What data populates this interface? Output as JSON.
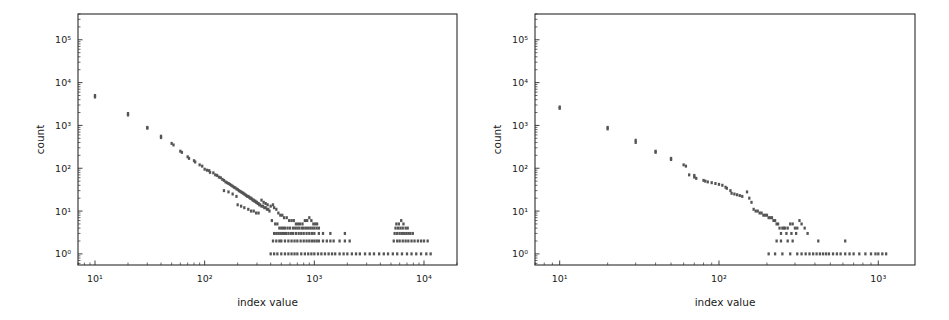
{
  "figure": {
    "background_color": "#ffffff",
    "marker_color": "#555555",
    "axis_color": "#2b2b2b",
    "panel_count": 2
  },
  "chart_data": [
    {
      "type": "scatter",
      "panel": "left",
      "title": "",
      "xlabel": "index value",
      "ylabel": "count",
      "xscale": "log",
      "yscale": "log",
      "xlim": [
        7.0,
        20000.0
      ],
      "ylim": [
        0.55,
        400000.0
      ],
      "grid": false,
      "legend": null,
      "xtick_labels": [
        "10¹",
        "10²",
        "10³",
        "10⁴"
      ],
      "xtick_values": [
        10,
        100,
        1000,
        10000
      ],
      "ytick_labels": [
        "10⁰",
        "10¹",
        "10²",
        "10³",
        "10⁴",
        "10⁵"
      ],
      "ytick_values": [
        1,
        10,
        100,
        1000,
        10000,
        100000
      ],
      "points": [
        [
          10,
          5000
        ],
        [
          10,
          4600
        ],
        [
          20,
          1900
        ],
        [
          20,
          1750
        ],
        [
          30,
          900
        ],
        [
          30,
          860
        ],
        [
          40,
          560
        ],
        [
          40,
          520
        ],
        [
          50,
          380
        ],
        [
          52,
          350
        ],
        [
          60,
          250
        ],
        [
          62,
          235
        ],
        [
          70,
          185
        ],
        [
          72,
          170
        ],
        [
          80,
          150
        ],
        [
          82,
          140
        ],
        [
          90,
          120
        ],
        [
          95,
          112
        ],
        [
          100,
          95
        ],
        [
          105,
          90
        ],
        [
          110,
          88
        ],
        [
          112,
          80
        ],
        [
          120,
          78
        ],
        [
          125,
          70
        ],
        [
          130,
          68
        ],
        [
          135,
          62
        ],
        [
          140,
          60
        ],
        [
          145,
          55
        ],
        [
          150,
          52
        ],
        [
          155,
          48
        ],
        [
          160,
          46
        ],
        [
          165,
          44
        ],
        [
          170,
          42
        ],
        [
          175,
          40
        ],
        [
          180,
          38
        ],
        [
          185,
          36
        ],
        [
          190,
          35
        ],
        [
          195,
          33
        ],
        [
          200,
          32
        ],
        [
          205,
          30
        ],
        [
          210,
          29
        ],
        [
          215,
          28
        ],
        [
          220,
          27
        ],
        [
          225,
          26
        ],
        [
          230,
          25
        ],
        [
          235,
          24
        ],
        [
          240,
          23
        ],
        [
          245,
          22
        ],
        [
          250,
          22
        ],
        [
          255,
          21
        ],
        [
          260,
          20
        ],
        [
          265,
          20
        ],
        [
          270,
          19
        ],
        [
          275,
          18
        ],
        [
          280,
          18
        ],
        [
          285,
          17
        ],
        [
          290,
          17
        ],
        [
          295,
          16
        ],
        [
          300,
          16
        ],
        [
          305,
          15
        ],
        [
          310,
          15
        ],
        [
          315,
          14
        ],
        [
          320,
          14
        ],
        [
          330,
          13
        ],
        [
          340,
          13
        ],
        [
          350,
          12
        ],
        [
          360,
          12
        ],
        [
          370,
          11
        ],
        [
          380,
          11
        ],
        [
          390,
          10
        ],
        [
          200,
          14
        ],
        [
          215,
          13
        ],
        [
          230,
          12
        ],
        [
          250,
          11
        ],
        [
          265,
          10
        ],
        [
          280,
          10
        ],
        [
          295,
          9
        ],
        [
          310,
          9
        ],
        [
          150,
          30
        ],
        [
          165,
          28
        ],
        [
          180,
          25
        ],
        [
          195,
          22
        ],
        [
          330,
          18
        ],
        [
          345,
          16
        ],
        [
          360,
          15
        ],
        [
          375,
          14
        ],
        [
          400,
          13
        ],
        [
          420,
          14
        ],
        [
          430,
          12
        ],
        [
          450,
          11
        ],
        [
          470,
          9
        ],
        [
          490,
          8
        ],
        [
          510,
          8
        ],
        [
          530,
          7
        ],
        [
          560,
          7
        ],
        [
          590,
          6
        ],
        [
          620,
          6
        ],
        [
          650,
          6
        ],
        [
          680,
          5
        ],
        [
          710,
          5
        ],
        [
          740,
          5
        ],
        [
          780,
          5
        ],
        [
          820,
          6
        ],
        [
          860,
          6
        ],
        [
          900,
          7
        ],
        [
          940,
          6
        ],
        [
          980,
          5
        ],
        [
          1020,
          5
        ],
        [
          1060,
          5
        ],
        [
          410,
          6
        ],
        [
          440,
          5
        ],
        [
          460,
          5
        ],
        [
          480,
          4
        ],
        [
          500,
          4
        ],
        [
          520,
          4
        ],
        [
          540,
          4
        ],
        [
          570,
          4
        ],
        [
          600,
          4
        ],
        [
          640,
          4
        ],
        [
          670,
          4
        ],
        [
          700,
          4
        ],
        [
          730,
          4
        ],
        [
          770,
          4
        ],
        [
          800,
          4
        ],
        [
          840,
          4
        ],
        [
          880,
          4
        ],
        [
          920,
          4
        ],
        [
          960,
          4
        ],
        [
          1000,
          4
        ],
        [
          1050,
          4
        ],
        [
          1100,
          4
        ],
        [
          430,
          3
        ],
        [
          450,
          3
        ],
        [
          470,
          3
        ],
        [
          490,
          3
        ],
        [
          510,
          3
        ],
        [
          530,
          3
        ],
        [
          550,
          3
        ],
        [
          580,
          3
        ],
        [
          610,
          3
        ],
        [
          640,
          3
        ],
        [
          680,
          3
        ],
        [
          720,
          3
        ],
        [
          760,
          3
        ],
        [
          800,
          3
        ],
        [
          850,
          3
        ],
        [
          900,
          3
        ],
        [
          950,
          3
        ],
        [
          1000,
          3
        ],
        [
          1100,
          3
        ],
        [
          1200,
          3
        ],
        [
          1400,
          3
        ],
        [
          1900,
          3
        ],
        [
          420,
          2
        ],
        [
          450,
          2
        ],
        [
          480,
          2
        ],
        [
          500,
          2
        ],
        [
          540,
          2
        ],
        [
          580,
          2
        ],
        [
          620,
          2
        ],
        [
          660,
          2
        ],
        [
          700,
          2
        ],
        [
          750,
          2
        ],
        [
          800,
          2
        ],
        [
          850,
          2
        ],
        [
          900,
          2
        ],
        [
          950,
          2
        ],
        [
          1000,
          2
        ],
        [
          1050,
          2
        ],
        [
          1100,
          2
        ],
        [
          1200,
          2
        ],
        [
          1300,
          2
        ],
        [
          1400,
          2
        ],
        [
          1500,
          2
        ],
        [
          1700,
          2
        ],
        [
          1900,
          2
        ],
        [
          2100,
          2
        ],
        [
          400,
          1
        ],
        [
          430,
          1
        ],
        [
          460,
          1
        ],
        [
          500,
          1
        ],
        [
          540,
          1
        ],
        [
          580,
          1
        ],
        [
          620,
          1
        ],
        [
          660,
          1
        ],
        [
          700,
          1
        ],
        [
          760,
          1
        ],
        [
          820,
          1
        ],
        [
          880,
          1
        ],
        [
          940,
          1
        ],
        [
          1000,
          1
        ],
        [
          1080,
          1
        ],
        [
          1160,
          1
        ],
        [
          1250,
          1
        ],
        [
          1350,
          1
        ],
        [
          1450,
          1
        ],
        [
          1550,
          1
        ],
        [
          1700,
          1
        ],
        [
          1850,
          1
        ],
        [
          2000,
          1
        ],
        [
          2200,
          1
        ],
        [
          2400,
          1
        ],
        [
          2600,
          1
        ],
        [
          2900,
          1
        ],
        [
          3200,
          1
        ],
        [
          3500,
          1
        ],
        [
          3900,
          1
        ],
        [
          4300,
          1
        ],
        [
          4700,
          1
        ],
        [
          5200,
          1
        ],
        [
          5700,
          1
        ],
        [
          6300,
          1
        ],
        [
          7000,
          1
        ],
        [
          7700,
          1
        ],
        [
          8500,
          1
        ],
        [
          9400,
          1
        ],
        [
          10500,
          1
        ],
        [
          11500,
          1
        ],
        [
          5600,
          5
        ],
        [
          5900,
          5
        ],
        [
          6200,
          6
        ],
        [
          6500,
          5
        ],
        [
          5500,
          4
        ],
        [
          5800,
          4
        ],
        [
          6100,
          4
        ],
        [
          6400,
          4
        ],
        [
          6800,
          4
        ],
        [
          7100,
          4
        ],
        [
          5400,
          3
        ],
        [
          5700,
          3
        ],
        [
          6000,
          3
        ],
        [
          6300,
          3
        ],
        [
          6600,
          3
        ],
        [
          6900,
          3
        ],
        [
          7200,
          3
        ],
        [
          7500,
          3
        ],
        [
          7900,
          3
        ],
        [
          5300,
          2
        ],
        [
          5700,
          2
        ],
        [
          6000,
          2
        ],
        [
          6400,
          2
        ],
        [
          6800,
          2
        ],
        [
          7200,
          2
        ],
        [
          7700,
          2
        ],
        [
          8200,
          2
        ],
        [
          8800,
          2
        ],
        [
          9400,
          2
        ],
        [
          10000,
          2
        ],
        [
          10800,
          2
        ]
      ]
    },
    {
      "type": "scatter",
      "panel": "right",
      "title": "",
      "xlabel": "index value",
      "ylabel": "count",
      "xscale": "log",
      "yscale": "log",
      "xlim": [
        7.0,
        1700.0
      ],
      "ylim": [
        0.55,
        400000.0
      ],
      "grid": false,
      "legend": null,
      "xtick_labels": [
        "10¹",
        "10²",
        "10³"
      ],
      "xtick_values": [
        10,
        100,
        1000
      ],
      "ytick_labels": [
        "10⁰",
        "10¹",
        "10²",
        "10³",
        "10⁴",
        "10⁵"
      ],
      "ytick_values": [
        1,
        10,
        100,
        1000,
        10000,
        100000
      ],
      "points": [
        [
          10,
          2700
        ],
        [
          10,
          2500
        ],
        [
          20,
          900
        ],
        [
          20,
          830
        ],
        [
          30,
          450
        ],
        [
          30,
          400
        ],
        [
          40,
          250
        ],
        [
          40,
          235
        ],
        [
          50,
          170
        ],
        [
          50,
          160
        ],
        [
          60,
          120
        ],
        [
          62,
          112
        ],
        [
          65,
          70
        ],
        [
          70,
          68
        ],
        [
          70,
          62
        ],
        [
          72,
          58
        ],
        [
          80,
          52
        ],
        [
          82,
          50
        ],
        [
          85,
          48
        ],
        [
          90,
          46
        ],
        [
          95,
          44
        ],
        [
          100,
          42
        ],
        [
          105,
          40
        ],
        [
          110,
          36
        ],
        [
          112,
          34
        ],
        [
          118,
          30
        ],
        [
          120,
          26
        ],
        [
          125,
          25
        ],
        [
          130,
          24
        ],
        [
          135,
          23
        ],
        [
          140,
          22
        ],
        [
          150,
          28
        ],
        [
          155,
          20
        ],
        [
          160,
          16
        ],
        [
          165,
          11
        ],
        [
          170,
          10
        ],
        [
          175,
          10
        ],
        [
          180,
          9
        ],
        [
          185,
          9
        ],
        [
          190,
          8
        ],
        [
          195,
          8
        ],
        [
          200,
          8
        ],
        [
          205,
          7
        ],
        [
          210,
          7
        ],
        [
          215,
          7
        ],
        [
          220,
          6
        ],
        [
          225,
          6
        ],
        [
          230,
          5
        ],
        [
          235,
          5
        ],
        [
          240,
          4
        ],
        [
          250,
          4
        ],
        [
          255,
          4
        ],
        [
          260,
          4
        ],
        [
          270,
          4
        ],
        [
          280,
          5
        ],
        [
          290,
          5
        ],
        [
          300,
          4
        ],
        [
          310,
          4
        ],
        [
          320,
          6
        ],
        [
          330,
          5
        ],
        [
          345,
          4
        ],
        [
          360,
          3
        ],
        [
          245,
          3
        ],
        [
          265,
          3
        ],
        [
          285,
          3
        ],
        [
          305,
          3
        ],
        [
          230,
          2
        ],
        [
          245,
          2
        ],
        [
          270,
          2
        ],
        [
          290,
          2
        ],
        [
          420,
          2
        ],
        [
          620,
          2
        ],
        [
          205,
          1
        ],
        [
          225,
          1
        ],
        [
          250,
          1
        ],
        [
          280,
          1
        ],
        [
          310,
          1
        ],
        [
          330,
          1
        ],
        [
          350,
          1
        ],
        [
          370,
          1
        ],
        [
          390,
          1
        ],
        [
          410,
          1
        ],
        [
          430,
          1
        ],
        [
          450,
          1
        ],
        [
          470,
          1
        ],
        [
          490,
          1
        ],
        [
          520,
          1
        ],
        [
          550,
          1
        ],
        [
          580,
          1
        ],
        [
          620,
          1
        ],
        [
          660,
          1
        ],
        [
          700,
          1
        ],
        [
          760,
          1
        ],
        [
          830,
          1
        ],
        [
          900,
          1
        ],
        [
          960,
          1
        ],
        [
          1000,
          1
        ],
        [
          1060,
          1
        ],
        [
          1120,
          1
        ]
      ]
    }
  ]
}
